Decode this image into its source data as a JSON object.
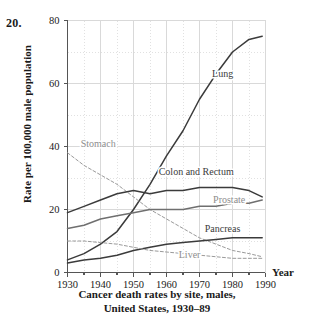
{
  "problem_number": "20.",
  "axes": {
    "ylabel": "Rate per 100,000 male population",
    "xlabel": "Year",
    "y_ticks": [
      "0",
      "20",
      "40",
      "60",
      "80"
    ],
    "x_ticks": [
      "1930",
      "1940",
      "1950",
      "1960",
      "1970",
      "1980",
      "1990"
    ]
  },
  "caption": {
    "line1": "Cancer death rates by site, males,",
    "line2": "United States, 1930–89"
  },
  "colors": {
    "solid_dark": "#3b3b3b",
    "mid_grey": "#6f6f6f",
    "light_grey": "#9a9a9a",
    "grid": "#d9d9d9",
    "axis": "#555555",
    "background": "#ffffff"
  },
  "chart_data": {
    "type": "line",
    "title": "Cancer death rates by site, males, United States, 1930–89",
    "xlabel": "Year",
    "ylabel": "Rate per 100,000 male population",
    "xlim": [
      1930,
      1990
    ],
    "ylim": [
      0,
      80
    ],
    "grid": true,
    "legend": "inline-labels",
    "x": [
      1930,
      1935,
      1940,
      1945,
      1950,
      1955,
      1960,
      1965,
      1970,
      1975,
      1980,
      1985,
      1989
    ],
    "series": [
      {
        "name": "Lung",
        "style": "solid",
        "color": "#3b3b3b",
        "label_x": 1977,
        "label_y": 62,
        "values": [
          4,
          6,
          9,
          13,
          20,
          28,
          37,
          45,
          55,
          63,
          70,
          74,
          75
        ]
      },
      {
        "name": "Stomach",
        "style": "dashed",
        "color": "#9a9a9a",
        "label_x": 1934,
        "label_y": 40,
        "values": [
          38,
          34,
          31,
          28,
          24,
          20,
          17,
          14,
          11,
          9,
          7,
          6,
          5
        ]
      },
      {
        "name": "Colon and Rectum",
        "style": "solid",
        "color": "#3b3b3b",
        "label_x": 1969,
        "label_y": 31,
        "values": [
          19,
          21,
          23,
          25,
          26,
          25,
          26,
          26,
          27,
          27,
          27,
          26,
          24
        ]
      },
      {
        "name": "Prostate",
        "style": "solid",
        "color": "#6f6f6f",
        "label_x": 1979,
        "label_y": 22,
        "values": [
          14,
          15,
          17,
          18,
          19,
          20,
          20,
          20,
          21,
          21,
          22,
          22,
          23
        ]
      },
      {
        "name": "Pancreas",
        "style": "solid",
        "color": "#3b3b3b",
        "label_x": 1977,
        "label_y": 13,
        "values": [
          3,
          4,
          4.5,
          5.5,
          7,
          8,
          9,
          9.5,
          10,
          10.5,
          11,
          11,
          11
        ]
      },
      {
        "name": "Liver",
        "style": "dashed",
        "color": "#9a9a9a",
        "label_x": 1967,
        "label_y": 4.5,
        "values": [
          10,
          10,
          9.5,
          9,
          8,
          7,
          6.5,
          6,
          5.5,
          5,
          4.5,
          4.5,
          4.5
        ]
      }
    ]
  }
}
